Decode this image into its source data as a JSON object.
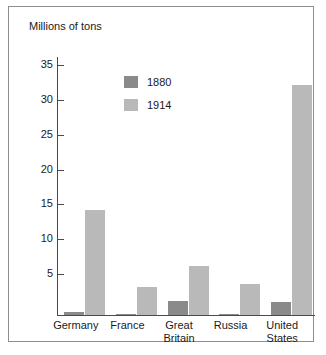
{
  "chart_data": {
    "type": "bar",
    "title": "Millions of tons",
    "xlabel": "",
    "ylabel": "",
    "ylim": [
      0,
      37
    ],
    "yticks": [
      5,
      10,
      15,
      20,
      25,
      30,
      35
    ],
    "grid": false,
    "legend_position": "inside-upper-left",
    "categories": [
      "Germany",
      "France",
      "Great Britain",
      "Russia",
      "United States"
    ],
    "category_lines": [
      [
        "Germany"
      ],
      [
        "France"
      ],
      [
        "Great",
        "Britain"
      ],
      [
        "Russia"
      ],
      [
        "United",
        "States"
      ]
    ],
    "series": [
      {
        "name": "1880",
        "color": "#8a8a8a",
        "values": [
          0.5,
          0.2,
          2.0,
          0.2,
          1.8
        ]
      },
      {
        "name": "1914",
        "color": "#b9b9b9",
        "values": [
          15,
          4,
          7,
          4.5,
          33
        ]
      }
    ]
  },
  "frame": {
    "border_color": "#8e8e8e",
    "axis_color": "#4a4a4a",
    "background": "#ffffff"
  }
}
